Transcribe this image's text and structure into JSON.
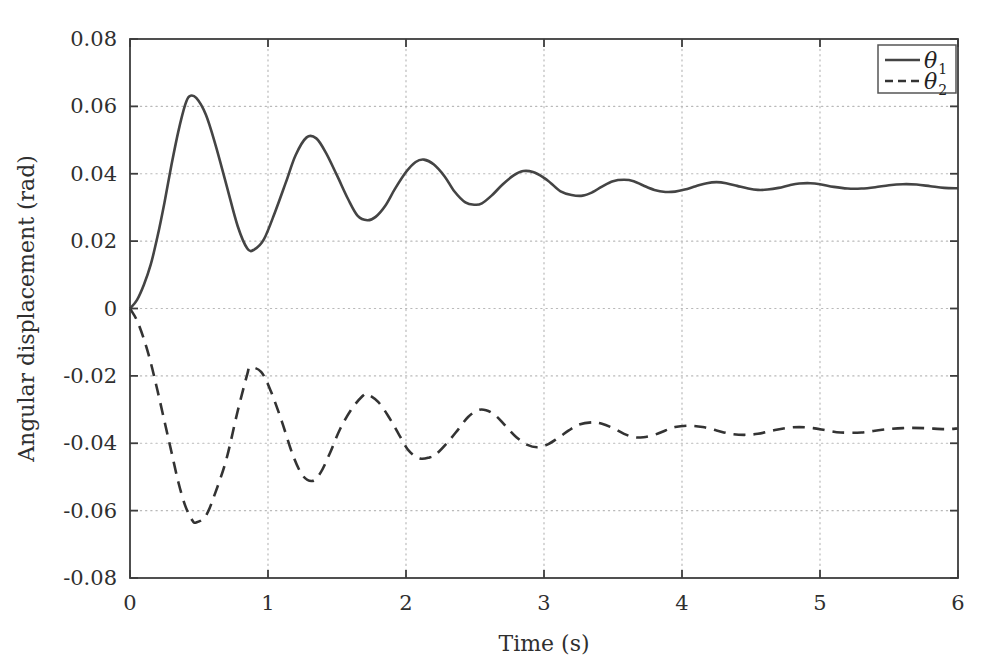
{
  "chart_data": {
    "type": "line",
    "title": "",
    "xlabel": "Time (s)",
    "ylabel": "Angular displacement (rad)",
    "xlim": [
      0,
      6
    ],
    "ylim": [
      -0.08,
      0.08
    ],
    "xticks": [
      "0",
      "1",
      "2",
      "3",
      "4",
      "5",
      "6"
    ],
    "xtick_values": [
      0,
      1,
      2,
      3,
      4,
      5,
      6
    ],
    "yticks": [
      "0.08",
      "0.06",
      "0.04",
      "0.02",
      "0",
      "-0.02",
      "-0.04",
      "-0.06",
      "-0.08"
    ],
    "ytick_values": [
      0.08,
      0.06,
      0.04,
      0.02,
      0,
      -0.02,
      -0.04,
      -0.06,
      -0.08
    ],
    "grid": true,
    "grid_style": "dotted",
    "grid_color": "#b9b9b9",
    "axes_color": "#3d3d3d",
    "background": "#ffffff",
    "legend_position": "top-right",
    "legend": [
      {
        "label": "θ",
        "subscript": "1",
        "style": "solid",
        "color": "#444444"
      },
      {
        "label": "θ",
        "subscript": "2",
        "style": "dashed",
        "color": "#333333"
      }
    ],
    "series": [
      {
        "name": "theta1",
        "style": "solid",
        "color": "#444444",
        "x": [
          0,
          0.05,
          0.1,
          0.15,
          0.2,
          0.25,
          0.3,
          0.35,
          0.4,
          0.43,
          0.48,
          0.55,
          0.62,
          0.7,
          0.78,
          0.85,
          0.9,
          0.97,
          1.05,
          1.13,
          1.2,
          1.28,
          1.35,
          1.42,
          1.5,
          1.58,
          1.65,
          1.72,
          1.78,
          1.85,
          1.92,
          2.0,
          2.07,
          2.13,
          2.2,
          2.28,
          2.35,
          2.43,
          2.5,
          2.55,
          2.62,
          2.7,
          2.78,
          2.85,
          2.92,
          3.0,
          3.05,
          3.12,
          3.2,
          3.28,
          3.35,
          3.42,
          3.5,
          3.58,
          3.65,
          3.72,
          3.8,
          3.88,
          3.95,
          4.02,
          4.1,
          4.18,
          4.25,
          4.32,
          4.4,
          4.48,
          4.55,
          4.62,
          4.7,
          4.78,
          4.85,
          4.93,
          5.0,
          5.1,
          5.2,
          5.3,
          5.4,
          5.5,
          5.6,
          5.7,
          5.8,
          5.9,
          6.0
        ],
        "y": [
          0,
          0.0025,
          0.007,
          0.013,
          0.0215,
          0.0315,
          0.0425,
          0.0525,
          0.0605,
          0.063,
          0.0625,
          0.0575,
          0.0485,
          0.0365,
          0.0245,
          0.0178,
          0.0175,
          0.0205,
          0.0285,
          0.0375,
          0.0455,
          0.0508,
          0.0505,
          0.0462,
          0.0395,
          0.0325,
          0.0275,
          0.0262,
          0.0272,
          0.0305,
          0.0355,
          0.0405,
          0.0435,
          0.0442,
          0.0428,
          0.0392,
          0.0348,
          0.0315,
          0.0308,
          0.0312,
          0.0335,
          0.0368,
          0.0395,
          0.0408,
          0.0405,
          0.0388,
          0.0372,
          0.0348,
          0.0337,
          0.0335,
          0.0345,
          0.0362,
          0.0378,
          0.0382,
          0.0378,
          0.0365,
          0.0352,
          0.0346,
          0.0347,
          0.0353,
          0.0363,
          0.0372,
          0.0375,
          0.0372,
          0.0364,
          0.0356,
          0.0352,
          0.0353,
          0.0358,
          0.0366,
          0.0371,
          0.0372,
          0.0369,
          0.0361,
          0.0356,
          0.0356,
          0.036,
          0.0366,
          0.0369,
          0.0368,
          0.0363,
          0.0358,
          0.0357
        ]
      },
      {
        "name": "theta2",
        "style": "dashed",
        "color": "#333333",
        "x": [
          0,
          0.05,
          0.1,
          0.15,
          0.2,
          0.25,
          0.3,
          0.35,
          0.4,
          0.45,
          0.48,
          0.55,
          0.62,
          0.7,
          0.78,
          0.85,
          0.87,
          0.95,
          1.02,
          1.1,
          1.18,
          1.25,
          1.32,
          1.38,
          1.45,
          1.52,
          1.6,
          1.68,
          1.72,
          1.8,
          1.88,
          1.95,
          2.02,
          2.1,
          2.17,
          2.22,
          2.3,
          2.38,
          2.45,
          2.52,
          2.58,
          2.65,
          2.72,
          2.8,
          2.88,
          2.95,
          3.02,
          3.1,
          3.18,
          3.25,
          3.35,
          3.42,
          3.5,
          3.58,
          3.65,
          3.72,
          3.8,
          3.88,
          3.95,
          4.05,
          4.15,
          4.25,
          4.35,
          4.45,
          4.55,
          4.65,
          4.75,
          4.85,
          4.95,
          5.05,
          5.15,
          5.3,
          5.45,
          5.6,
          5.75,
          5.9,
          6.0
        ],
        "y": [
          0,
          -0.0035,
          -0.009,
          -0.016,
          -0.0245,
          -0.0335,
          -0.0425,
          -0.0515,
          -0.0585,
          -0.0628,
          -0.0635,
          -0.0615,
          -0.0545,
          -0.0445,
          -0.0305,
          -0.0195,
          -0.0175,
          -0.0188,
          -0.0245,
          -0.0335,
          -0.0435,
          -0.0495,
          -0.0512,
          -0.0488,
          -0.0428,
          -0.036,
          -0.0302,
          -0.0262,
          -0.0255,
          -0.0278,
          -0.0325,
          -0.0375,
          -0.0422,
          -0.0445,
          -0.0442,
          -0.0432,
          -0.0398,
          -0.0358,
          -0.0322,
          -0.0302,
          -0.0302,
          -0.0318,
          -0.0348,
          -0.0382,
          -0.0405,
          -0.0412,
          -0.0405,
          -0.0385,
          -0.0362,
          -0.0345,
          -0.0338,
          -0.0342,
          -0.0355,
          -0.0372,
          -0.0382,
          -0.0382,
          -0.0375,
          -0.0362,
          -0.0352,
          -0.0348,
          -0.0352,
          -0.0362,
          -0.0372,
          -0.0375,
          -0.0372,
          -0.0363,
          -0.0355,
          -0.0352,
          -0.0355,
          -0.0362,
          -0.0368,
          -0.0368,
          -0.036,
          -0.0355,
          -0.0355,
          -0.0358,
          -0.0356
        ]
      }
    ]
  }
}
